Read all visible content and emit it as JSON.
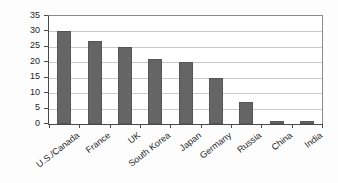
{
  "chart_data": {
    "type": "bar",
    "title": "",
    "xlabel": "",
    "ylabel": "Dollars ($)",
    "categories": [
      "U.S./Canada",
      "France",
      "UK",
      "South Korea",
      "Japan",
      "Germany",
      "Russia",
      "China",
      "India"
    ],
    "values": [
      30,
      27,
      25,
      21,
      20,
      15,
      7,
      1,
      1
    ],
    "ylim": [
      0,
      35
    ],
    "ytick_step": 5,
    "yticks": [
      0,
      5,
      10,
      15,
      20,
      25,
      30,
      35
    ],
    "ytick_labels": [
      "0",
      "5",
      "10",
      "15",
      "20",
      "25",
      "30",
      "35"
    ],
    "grid": true,
    "grid_axis": "y",
    "legend": false,
    "legend_position": "none",
    "bar_color": "#656565",
    "gridline_color": "#c9c9c9",
    "axis_color": "#4a4a4a",
    "background_color": "#ffffff"
  }
}
